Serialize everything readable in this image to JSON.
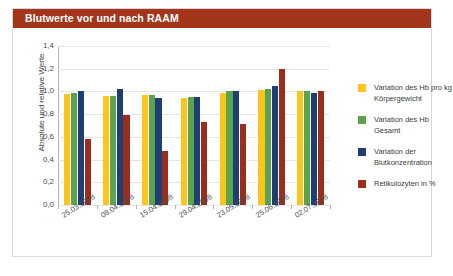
{
  "header": {
    "title": "Blutwerte vor und nach RAAM",
    "title_bg": "#a4351a",
    "title_color": "#ffffff"
  },
  "legend": {
    "position": "right",
    "entries": [
      {
        "label": "Variation des Hb pro kg Körpergewicht",
        "color": "#fbc51c"
      },
      {
        "label": "Variation des Hb Gesamt",
        "color": "#5ca34e"
      },
      {
        "label": "Variation der Blutkonzentration",
        "color": "#1d3f73"
      },
      {
        "label": "Retikulozyten in %",
        "color": "#9c2d1a"
      }
    ]
  },
  "axes": {
    "ylabel": "Absolute und relative Werte",
    "xlabel": "",
    "yticks": [
      "0,0",
      "0,2",
      "0,4",
      "0,6",
      "0,8",
      "1,0",
      "1,2",
      "1,4"
    ],
    "ylim": [
      0,
      1.4
    ],
    "grid": "horizontal"
  },
  "chart_data": {
    "type": "bar",
    "title": "Blutwerte vor und nach RAAM",
    "xlabel": "",
    "ylabel": "Absolute und relative Werte",
    "ylim": [
      0,
      1.4
    ],
    "ytick_labels": [
      "0,0",
      "0,2",
      "0,4",
      "0,6",
      "0,8",
      "1,0",
      "1,2",
      "1,4"
    ],
    "grid": true,
    "legend_position": "right",
    "categories": [
      "25.03.2008",
      "08.04.2008",
      "15.04.2008",
      "29.04.2008",
      "23.05.2008",
      "25.06.2008",
      "02.07.2008"
    ],
    "series": [
      {
        "name": "Variation des Hb pro kg Körpergewicht",
        "color": "#fbc51c",
        "values": [
          0.98,
          0.96,
          0.97,
          0.94,
          0.99,
          1.01,
          1.0
        ]
      },
      {
        "name": "Variation des Hb Gesamt",
        "color": "#5ca34e",
        "values": [
          0.99,
          0.96,
          0.97,
          0.95,
          1.0,
          1.02,
          1.0
        ]
      },
      {
        "name": "Variation der Blutkonzentration",
        "color": "#1d3f73",
        "values": [
          1.0,
          1.02,
          0.94,
          0.95,
          1.0,
          1.05,
          0.99
        ]
      },
      {
        "name": "Retikulozyten in %",
        "color": "#9c2d1a",
        "values": [
          0.58,
          0.79,
          0.48,
          0.73,
          0.71,
          1.2,
          1.0
        ]
      }
    ]
  }
}
